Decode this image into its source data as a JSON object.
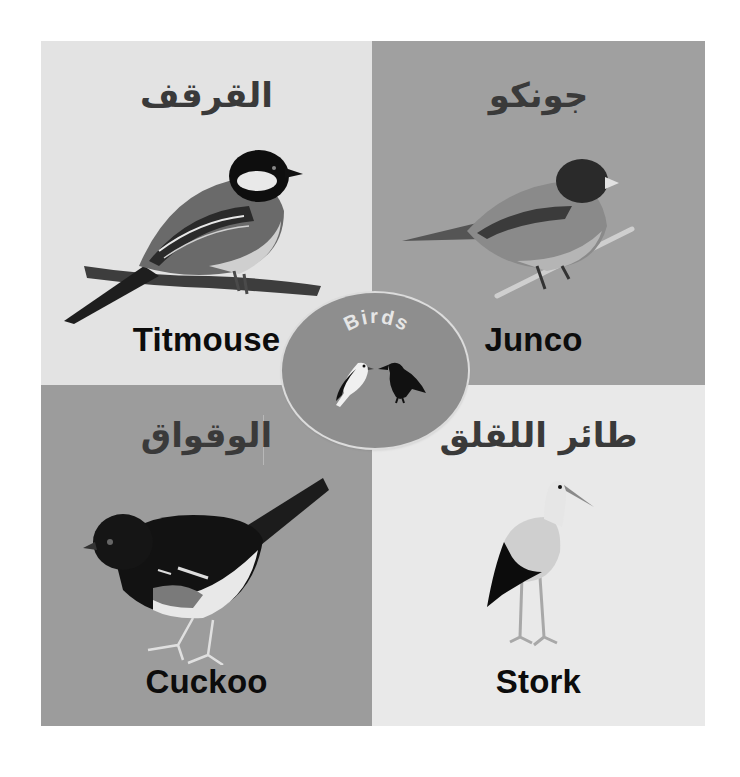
{
  "card": {
    "title": "Birds",
    "quadrants": [
      {
        "id": "titmouse",
        "english": "Titmouse",
        "arabic": "القرقف",
        "background": "#e3e3e3"
      },
      {
        "id": "junco",
        "english": "Junco",
        "arabic": "جونكو",
        "background": "#a0a0a0"
      },
      {
        "id": "cuckoo",
        "english": "Cuckoo",
        "arabic": "الوقواق",
        "background": "#9c9c9c"
      },
      {
        "id": "stork",
        "english": "Stork",
        "arabic": "طائر اللقلق",
        "background": "#e9e9e9"
      }
    ],
    "badge": {
      "label": "Birds",
      "background": "#8e8e8e",
      "icons": [
        "white-bird-icon",
        "crow-icon"
      ]
    }
  }
}
